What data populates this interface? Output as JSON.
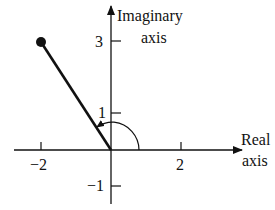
{
  "diagram": {
    "axes": {
      "real_label_line1": "Real",
      "real_label_line2": "axis",
      "imag_label_line1": "Imaginary",
      "imag_label_line2": "axis"
    },
    "ticks": {
      "real": [
        {
          "value": -2,
          "label": "−2"
        },
        {
          "value": 2,
          "label": "2"
        }
      ],
      "imag": [
        {
          "value": 3,
          "label": "3"
        },
        {
          "value": 1,
          "label": "1"
        },
        {
          "value": -1,
          "label": "−1"
        }
      ]
    },
    "point": {
      "re": -2,
      "im": 3
    },
    "angle_arc": {
      "from_deg": 0,
      "to_deg": 123.7,
      "direction": "counterclockwise"
    },
    "colors": {
      "ink": "#111111",
      "background": "#ffffff"
    }
  }
}
